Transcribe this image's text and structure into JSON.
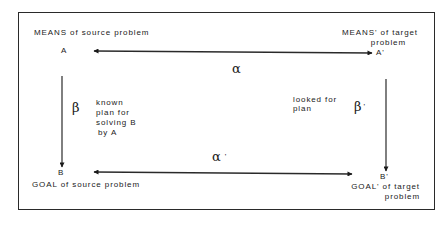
{
  "diagram": {
    "type": "analogy-mapping",
    "nodes": {
      "A": {
        "symbol": "A",
        "caption": "MEANS of source problem"
      },
      "A_prime": {
        "symbol": "A'",
        "caption_line1": "MEANS' of target",
        "caption_line2": "problem"
      },
      "B": {
        "symbol": "B",
        "caption": "GOAL of source problem"
      },
      "B_prime": {
        "symbol": "B'",
        "caption_line1": "GOAL' of target",
        "caption_line2": "problem"
      }
    },
    "edges": {
      "alpha": {
        "symbol": "α",
        "from": "A",
        "to": "A'",
        "direction": "bidirectional"
      },
      "alpha_prime": {
        "symbol": "α",
        "prime": "'",
        "from": "B",
        "to": "B'",
        "direction": "bidirectional"
      },
      "beta": {
        "symbol": "β",
        "from": "A",
        "to": "B",
        "direction": "down",
        "note_lines": [
          "known",
          "plan for",
          "solving B",
          "by A"
        ]
      },
      "beta_prime": {
        "symbol": "β",
        "prime": "'",
        "from": "A'",
        "to": "B'",
        "direction": "down",
        "note_lines": [
          "looked for",
          "plan"
        ]
      }
    },
    "colors": {
      "ink": "#1a1a1a",
      "background": "#ffffff"
    }
  }
}
